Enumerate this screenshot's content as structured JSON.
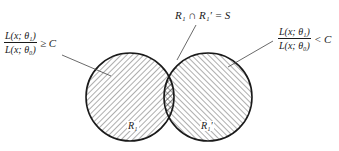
{
  "diagram": {
    "type": "venn",
    "top_label": "R₁ ∩ R₁′ = S",
    "left_condition": {
      "numerator": "L(x; θ₁)",
      "denominator": "L(x; θ₀)",
      "relation": "≥ C"
    },
    "right_condition": {
      "numerator": "L(x; θ₁)",
      "denominator": "L(x; θ₀)",
      "relation": "< C"
    },
    "regions": {
      "left": "R₁",
      "right": "R₁′"
    },
    "colors": {
      "stroke": "#1a1a1a",
      "hatch": "#333333",
      "background": "#ffffff"
    }
  }
}
